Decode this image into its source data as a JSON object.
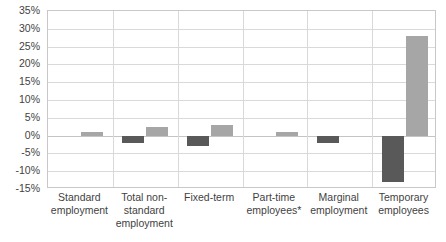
{
  "chart_data": {
    "type": "bar",
    "title": "",
    "subtitle": "",
    "xlabel": "",
    "ylabel": "",
    "ylim": [
      -15,
      35
    ],
    "ytick_step": 5,
    "grid": true,
    "legend_position": "none",
    "yticks": [
      "35%",
      "30%",
      "25%",
      "20%",
      "15%",
      "10%",
      "5%",
      "0%",
      "-5%",
      "-10%",
      "-15%"
    ],
    "ytick_values": [
      35,
      30,
      25,
      20,
      15,
      10,
      5,
      0,
      -5,
      -10,
      -15
    ],
    "categories": [
      "Standard employment",
      "Total non-standard employment",
      "Fixed-term",
      "Part-time employees*",
      "Marginal employment",
      "Temporary employees"
    ],
    "category_lines": [
      [
        "Standard",
        "employment"
      ],
      [
        "Total non-",
        "standard",
        "employment"
      ],
      [
        "Fixed-term"
      ],
      [
        "Part-time",
        "employees*"
      ],
      [
        "Marginal",
        "employment"
      ],
      [
        "Temporary",
        "employees"
      ]
    ],
    "series": [
      {
        "name": "series-1",
        "color": "#595959",
        "values": [
          0,
          -2,
          -3,
          0,
          -2,
          -13
        ]
      },
      {
        "name": "series-2",
        "color": "#a6a6a6",
        "values": [
          1,
          2.5,
          3,
          1,
          0,
          28
        ]
      }
    ],
    "footnote": "*"
  },
  "colors": {
    "series_dark": "#595959",
    "series_light": "#a6a6a6",
    "gridline": "#d9d9d9",
    "zero_line": "#c4c4c4",
    "plot_border": "#c8c8c8",
    "axis_text": "#3f3f3f",
    "background": "#ffffff"
  }
}
